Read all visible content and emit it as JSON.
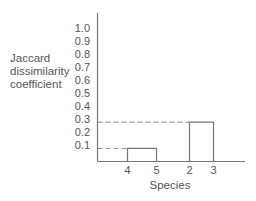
{
  "chart_data": {
    "type": "dendrogram-bar",
    "title": "",
    "xlabel": "Species",
    "ylabel_lines": [
      "Jaccard",
      "dissimilarity",
      "coefficient"
    ],
    "ylim": [
      0,
      1.0
    ],
    "yticks": [
      1.0,
      0.9,
      0.8,
      0.7,
      0.6,
      0.5,
      0.4,
      0.3,
      0.2,
      0.1
    ],
    "ytick_labels": [
      "1.0",
      "0.9",
      "0.8",
      "0.7",
      "0.6",
      "0.5",
      "0.4",
      "0.3",
      "0.2",
      "0.1"
    ],
    "clusters": [
      {
        "members": [
          "4",
          "5"
        ],
        "value": 0.1
      },
      {
        "members": [
          "2",
          "3"
        ],
        "value": 0.3
      }
    ],
    "x_tick_labels": [
      "4",
      "5",
      "2",
      "3"
    ],
    "reference_lines": [
      {
        "value": 0.3,
        "style": "dashed"
      },
      {
        "value": 0.1,
        "style": "dashed"
      }
    ],
    "grid": false,
    "legend": "none"
  },
  "colors": {
    "axis": "#777777",
    "text": "#555555",
    "dashed": "#888888"
  }
}
